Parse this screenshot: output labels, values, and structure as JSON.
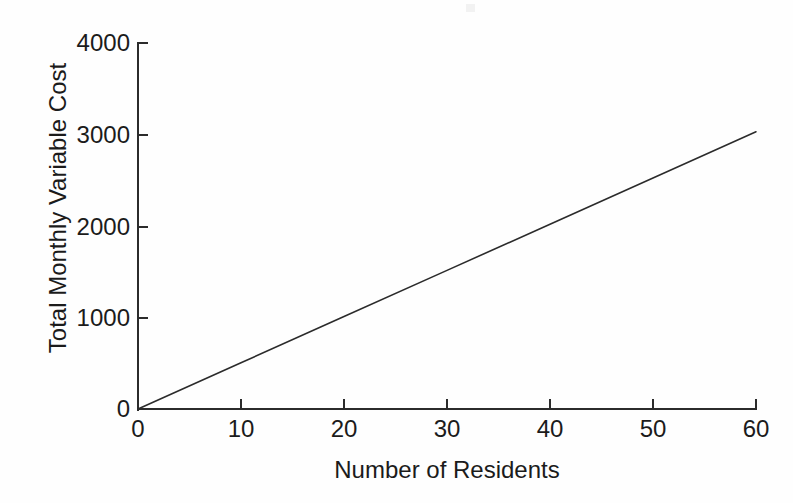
{
  "chart_data": {
    "type": "line",
    "title": "",
    "xlabel": "Number of Residents",
    "ylabel": "Total Monthly Variable Cost",
    "xlim": [
      0,
      60
    ],
    "ylim": [
      0,
      4000
    ],
    "xticks": [
      0,
      10,
      20,
      30,
      40,
      50,
      60
    ],
    "yticks": [
      0,
      1000,
      2000,
      3000,
      4000
    ],
    "xtick_labels": [
      "0",
      "10",
      "20",
      "30",
      "40",
      "50",
      "60"
    ],
    "ytick_labels": [
      "0",
      "1000",
      "2000",
      "3000",
      "4000"
    ],
    "grid": false,
    "legend": false,
    "series": [
      {
        "name": "Total Monthly Variable Cost",
        "color": "#2b2b2b",
        "x": [
          0,
          10,
          20,
          30,
          40,
          50,
          60
        ],
        "values": [
          0,
          505,
          1010,
          1515,
          2020,
          2525,
          3030
        ],
        "slope_per_resident": 50.5,
        "intercept": 0
      }
    ]
  },
  "axes": {
    "y_title": "Total Monthly Variable Cost",
    "x_title": "Number of Residents",
    "y_labels": [
      "4000",
      "3000",
      "2000",
      "1000",
      "0"
    ],
    "x_labels": [
      "0",
      "10",
      "20",
      "30",
      "40",
      "50",
      "60"
    ]
  },
  "colors": {
    "background": "#fefefe",
    "axis": "#2b2b2b",
    "line": "#2b2b2b",
    "text": "#1b1b1b"
  }
}
